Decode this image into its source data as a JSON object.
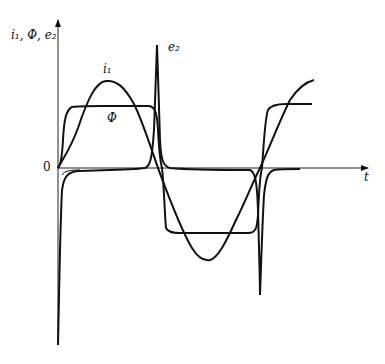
{
  "figure": {
    "axis_label_y": "i₁, Φ, e₂",
    "axis_label_x": "t",
    "origin_label": "0",
    "curve_labels": {
      "i1": "i₁",
      "phi": "Φ",
      "e2": "e₂"
    }
  },
  "curves": [
    {
      "name": "i1",
      "description": "primary current, sinusoidal"
    },
    {
      "name": "phi",
      "description": "magnetic flux, flat-topped (saturated) waveform"
    },
    {
      "name": "e2",
      "description": "secondary EMF, sharp spikes at flux transitions"
    }
  ],
  "colors": {
    "stroke": "#111111",
    "background": "#ffffff"
  }
}
